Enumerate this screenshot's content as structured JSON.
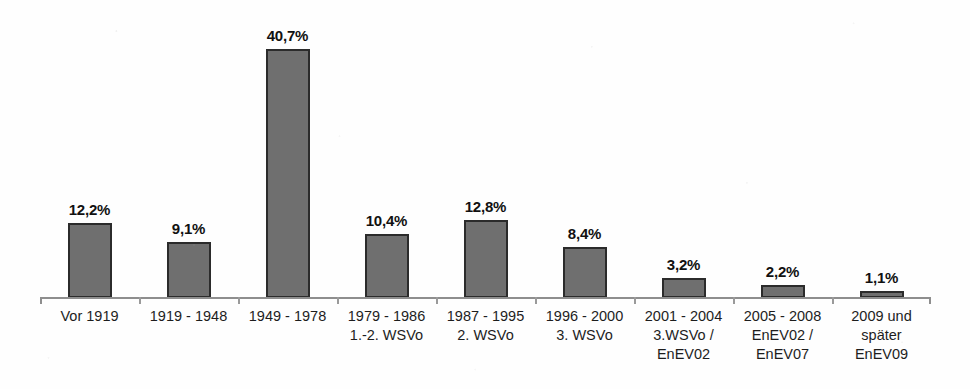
{
  "chart_data": {
    "type": "bar",
    "title": "",
    "subtitle": "",
    "xlabel": "",
    "ylabel": "",
    "ylim": [
      0,
      40.7
    ],
    "grid": false,
    "legend": "none",
    "value_suffix": "%",
    "decimal_separator": ",",
    "categories": [
      "Vor 1919",
      "1919 - 1948",
      "1949 - 1978",
      "1979 - 1986\n1.-2. WSVo",
      "1987 - 1995\n2. WSVo",
      "1996 - 2000\n3. WSVo",
      "2001 - 2004\n3.WSVo /\nEnEV02",
      "2005 - 2008\nEnEV02 /\nEnEV07",
      "2009 und\nspäter\nEnEV09"
    ],
    "values": [
      12.2,
      9.1,
      40.7,
      10.4,
      12.8,
      8.4,
      3.2,
      2.2,
      1.1
    ],
    "value_labels": [
      "12,2%",
      "9,1%",
      "40,7%",
      "10,4%",
      "12,8%",
      "8,4%",
      "3,2%",
      "2,2%",
      "1,1%"
    ],
    "colors": {
      "bar_fill": "#6f6f6f",
      "bar_border": "#2b2b2b",
      "axis": "#8e8e8e",
      "text": "#1a1a1a",
      "background": "#fefefe"
    }
  }
}
